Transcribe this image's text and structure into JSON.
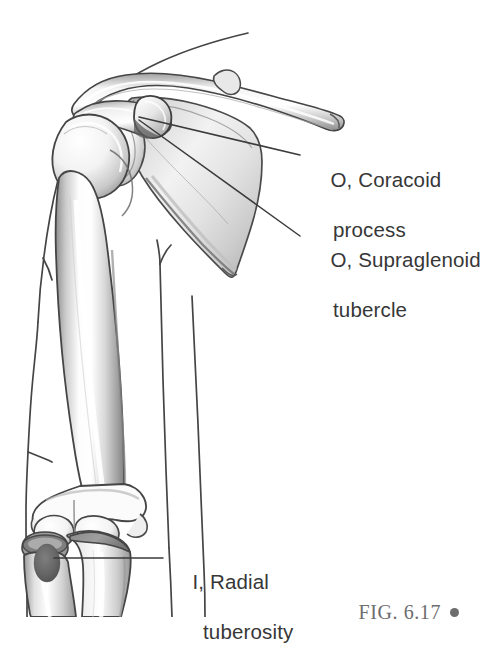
{
  "figure": {
    "domain": "anatomical-illustration",
    "caption": "FIG. 6.17",
    "caption_marker": "bullet-dot",
    "background_color": "#ffffff",
    "ink_color": "#3a3a3a",
    "text_color": "#373737",
    "caption_color": "#6d6d6d",
    "bone_fill": "#ffffff",
    "bone_shade": "#b9b9b9"
  },
  "annotations": [
    {
      "id": "coracoid",
      "prefix": "O,",
      "line1": "O, Coracoid",
      "line2": "process",
      "term": "Coracoid process",
      "marker": "O",
      "leader": {
        "from_x": 139,
        "from_y": 117,
        "to_x": 300,
        "to_y": 155
      }
    },
    {
      "id": "supraglenoid",
      "prefix": "O,",
      "line1": "O, Supraglenoid",
      "line2": "tubercle",
      "term": "Supraglenoid tubercle",
      "marker": "O",
      "leader": {
        "from_x": 139,
        "from_y": 120,
        "to_x": 300,
        "to_y": 236
      }
    },
    {
      "id": "radial-tuberosity",
      "prefix": "I,",
      "line1": "I, Radial",
      "line2": "tuberosity",
      "term": "Radial tuberosity",
      "marker": "I",
      "leader": {
        "from_x": 54,
        "from_y": 558,
        "to_x": 163,
        "to_y": 558
      }
    }
  ],
  "structures": [
    {
      "name": "clavicle",
      "label": "Clavicle"
    },
    {
      "name": "acromion",
      "label": "Acromion"
    },
    {
      "name": "coracoid-process",
      "label": "Coracoid process"
    },
    {
      "name": "scapula",
      "label": "Scapula"
    },
    {
      "name": "glenoid-cavity",
      "label": "Glenoid cavity"
    },
    {
      "name": "humerus",
      "label": "Humerus"
    },
    {
      "name": "humeral-head",
      "label": "Head of humerus"
    },
    {
      "name": "radius",
      "label": "Radius"
    },
    {
      "name": "ulna",
      "label": "Ulna"
    },
    {
      "name": "radial-tuberosity-mark",
      "label": "Radial tuberosity"
    },
    {
      "name": "body-contour",
      "label": "Body surface contour"
    }
  ]
}
